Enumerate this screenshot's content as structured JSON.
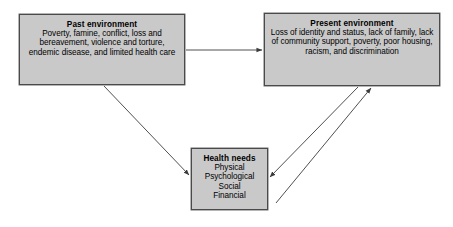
{
  "diagram": {
    "background_color": "#ffffff",
    "box_fill_color": "#c9c9c9",
    "box_border_color": "#4a4a4a",
    "arrow_color": "#3c3c3c",
    "nodes": [
      {
        "id": "past",
        "title": "Past environment",
        "body": "Poverty, famine, conflict, loss and bereavement, violence and torture, endemic disease, and limited health care"
      },
      {
        "id": "present",
        "title": "Present environment",
        "body": "Loss of identity and status, lack of family, lack of community support, poverty, poor housing, racism, and discrimination"
      },
      {
        "id": "health",
        "title": "Health needs",
        "body": "Physical Psychological Social Financial"
      }
    ],
    "edges": [
      {
        "id": "past-to-present",
        "from": "past",
        "to": "present",
        "direction": "right"
      },
      {
        "id": "past-to-health",
        "from": "past",
        "to": "health",
        "direction": "down-right"
      },
      {
        "id": "health-to-present",
        "from": "health",
        "to": "present",
        "direction": "up-right"
      },
      {
        "id": "present-to-health",
        "from": "present",
        "to": "health",
        "direction": "down-left"
      }
    ]
  }
}
